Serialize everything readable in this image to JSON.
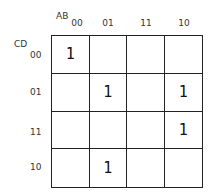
{
  "kmap": {
    "col_var": "AB",
    "row_var": "CD",
    "col_labels": [
      "00",
      "01",
      "11",
      "10"
    ],
    "row_labels": [
      "00",
      "01",
      "11",
      "10"
    ],
    "cells": [
      [
        "1",
        "",
        "",
        ""
      ],
      [
        "",
        "1",
        "",
        "1"
      ],
      [
        "",
        "",
        "",
        "1"
      ],
      [
        "",
        "1",
        "",
        ""
      ]
    ]
  }
}
